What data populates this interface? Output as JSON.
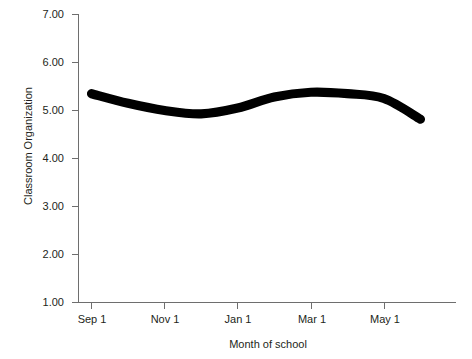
{
  "chart_data": {
    "type": "line",
    "title": "",
    "subtitle": "",
    "xlabel": "Month of school",
    "ylabel": "Classroom Organization",
    "ylim": [
      1.0,
      7.0
    ],
    "yticks": [
      "1.00",
      "2.00",
      "3.00",
      "4.00",
      "5.00",
      "6.00",
      "7.00"
    ],
    "ytick_values": [
      1.0,
      2.0,
      3.0,
      4.0,
      5.0,
      6.0,
      7.0
    ],
    "xticks": [
      "Sep 1",
      "Nov 1",
      "Jan 1",
      "Mar 1",
      "May 1"
    ],
    "grid": false,
    "legend": "none",
    "line_color": "#000000",
    "line_width_px": 9,
    "axis_color": "#6e6e6e",
    "background_color": "#ffffff",
    "series": [
      {
        "name": "Classroom Organization",
        "x": [
          "Sep 1",
          "Oct 1",
          "Nov 1",
          "Dec 1",
          "Jan 1",
          "Feb 1",
          "Mar 1",
          "Apr 1",
          "May 1",
          "Jun 1"
        ],
        "values": [
          5.35,
          5.15,
          5.0,
          4.93,
          5.05,
          5.28,
          5.38,
          5.35,
          5.25,
          4.82
        ]
      }
    ],
    "annotations": []
  },
  "axis": {
    "y_title": "Classroom Organization",
    "x_title": "Month of school",
    "y_labels": [
      "7.00",
      "6.00",
      "5.00",
      "4.00",
      "3.00",
      "2.00",
      "1.00"
    ],
    "x_labels": [
      "Sep 1",
      "Nov 1",
      "Jan 1",
      "Mar 1",
      "May 1"
    ]
  }
}
